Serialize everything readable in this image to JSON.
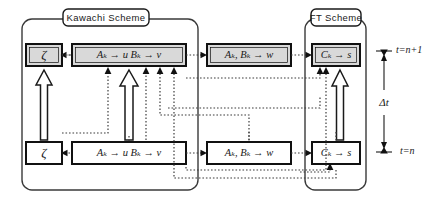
{
  "figure": {
    "groups": [
      {
        "id": "kawachi",
        "label": "Kawachi Scheme"
      },
      {
        "id": "ft",
        "label": "FT Scheme"
      }
    ],
    "rows": [
      {
        "id": "row-top",
        "time_label": "t=n+1",
        "shaded": true,
        "boxes": [
          {
            "id": "zeta-top",
            "text": "ζ"
          },
          {
            "id": "ab-top",
            "text": "Aₖ → u    Bₖ → v"
          },
          {
            "id": "w-top",
            "text": "Aₖ, Bₖ → w"
          },
          {
            "id": "c-top",
            "text": "Cₖ → s"
          }
        ]
      },
      {
        "id": "row-bottom",
        "time_label": "t=n",
        "shaded": false,
        "boxes": [
          {
            "id": "zeta-bottom",
            "text": "ζ"
          },
          {
            "id": "ab-bottom",
            "text": "Aₖ → u    Bₖ → v"
          },
          {
            "id": "w-bottom",
            "text": "Aₖ, Bₖ → w"
          },
          {
            "id": "c-bottom",
            "text": "Cₖ → s"
          }
        ]
      }
    ],
    "timescale": {
      "delta_label": "Δt",
      "top_label": "t=n+1",
      "bottom_label": "t=n"
    },
    "colors": {
      "shaded_fill": "#d9d9d9",
      "plain_fill": "#ffffff",
      "line": "#1a1a1a",
      "dotted_line": "#3d3d3d",
      "group_border": "#3a3a3a",
      "background": "#ffffff"
    },
    "legend_note": ""
  }
}
